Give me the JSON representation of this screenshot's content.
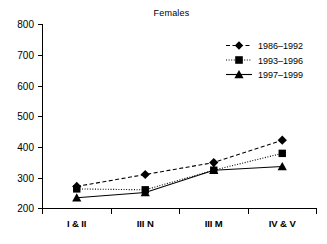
{
  "chart_data": {
    "type": "line",
    "title": "Females",
    "xlabel": "",
    "ylabel": "",
    "categories": [
      "I & II",
      "III N",
      "III M",
      "IV & V"
    ],
    "ylim": [
      200,
      800
    ],
    "yticks": [
      200,
      300,
      400,
      500,
      600,
      700,
      800
    ],
    "ytick_labels": [
      "200",
      "300",
      "400",
      "500",
      "600",
      "700",
      "800"
    ],
    "grid": false,
    "legend_position": "top-right",
    "series": [
      {
        "name": "1986–1992",
        "marker": "diamond",
        "linestyle": "dashed",
        "color": "#000000",
        "values": [
          272,
          311,
          350,
          423
        ]
      },
      {
        "name": "1993–1996",
        "marker": "square",
        "linestyle": "dotted",
        "color": "#000000",
        "values": [
          264,
          261,
          325,
          380
        ]
      },
      {
        "name": "1997–1999",
        "marker": "triangle",
        "linestyle": "solid",
        "color": "#000000",
        "values": [
          235,
          252,
          325,
          337
        ]
      }
    ]
  },
  "axis": {
    "y_tick_0": "200",
    "y_tick_1": "300",
    "y_tick_2": "400",
    "y_tick_3": "500",
    "y_tick_4": "600",
    "y_tick_5": "700",
    "y_tick_6": "800",
    "x_tick_0": "I & II",
    "x_tick_1": "III N",
    "x_tick_2": "III M",
    "x_tick_3": "IV & V"
  },
  "legend": {
    "entry_0": "1986–1992",
    "entry_1": "1993–1996",
    "entry_2": "1997–1999"
  },
  "colors": {
    "ink": "#000000",
    "background": "#ffffff"
  }
}
